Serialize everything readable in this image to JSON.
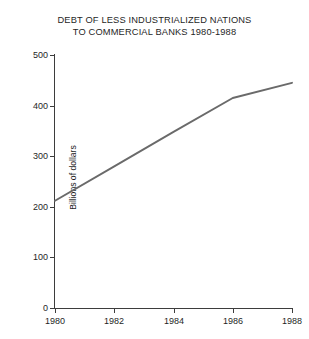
{
  "chart_data": {
    "type": "line",
    "title": "DEBT OF LESS INDUSTRIALIZED NATIONS TO COMMERCIAL BANKS 1980-1988",
    "title_lines": [
      "DEBT OF LESS INDUSTRIALIZED NATIONS",
      "TO COMMERCIAL BANKS 1980-1988"
    ],
    "xlabel": "",
    "ylabel": "Billions of dollars",
    "xlim": [
      1980,
      1988
    ],
    "ylim": [
      0,
      500
    ],
    "grid": false,
    "legend": false,
    "line_color": "#6a6a6a",
    "axis_color": "#3d3d3d",
    "background": "#ffffff",
    "x_ticks": [
      1980,
      1982,
      1984,
      1986,
      1988
    ],
    "x_tick_labels": [
      "1980",
      "1982",
      "1984",
      "1986",
      "1988"
    ],
    "y_ticks": [
      0,
      100,
      200,
      300,
      400,
      500
    ],
    "y_tick_labels": [
      "0",
      "100",
      "200",
      "300",
      "400",
      "500"
    ],
    "series": [
      {
        "name": "Debt to commercial banks",
        "x": [
          1980,
          1982,
          1984,
          1986,
          1988
        ],
        "values": [
          212,
          280,
          348,
          415,
          445
        ]
      }
    ]
  }
}
